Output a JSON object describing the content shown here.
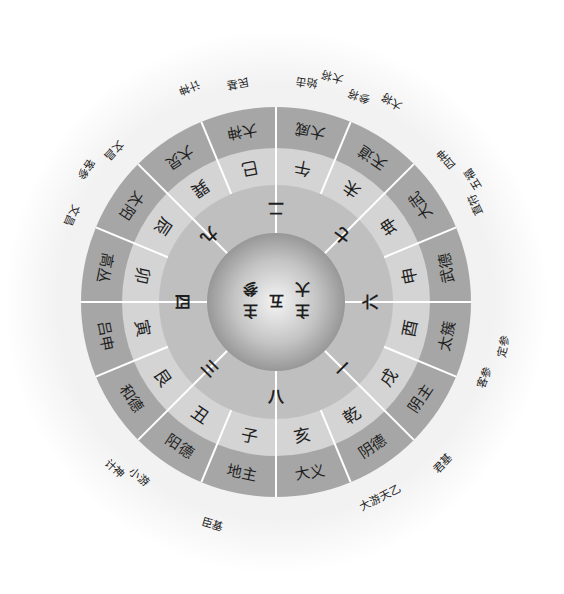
{
  "center": {
    "middle": "五",
    "right_column": [
      "主",
      "大"
    ],
    "left_column": [
      "主",
      "参"
    ]
  },
  "number_ring": [
    "二",
    "七",
    "六",
    "一",
    "八",
    "三",
    "四",
    "九"
  ],
  "branch_ring": [
    "午",
    "未",
    "坤",
    "申",
    "酉",
    "戌",
    "乾",
    "亥",
    "子",
    "丑",
    "艮",
    "寅",
    "卯",
    "辰",
    "巽",
    "巳"
  ],
  "outer_ring": [
    "大威",
    "天道",
    "大武",
    "武德",
    "太簇",
    "阴主",
    "阴德",
    "大义",
    "地主",
    "阳德",
    "和德",
    "吕申",
    "高丛",
    "太阳",
    "大炅",
    "大神"
  ],
  "external_labels": [
    {
      "text": "始击",
      "angle": 8
    },
    {
      "text": "大将",
      "angle": 14
    },
    {
      "text": "参将",
      "angle": 22
    },
    {
      "text": "大将",
      "angle": 30
    },
    {
      "text": "四神",
      "angle": 50
    },
    {
      "text": "五福",
      "angle": 58
    },
    {
      "text": "直符",
      "angle": 64
    },
    {
      "text": "定参",
      "angle": 101
    },
    {
      "text": "客参",
      "angle": 110
    },
    {
      "text": "君基",
      "angle": 134
    },
    {
      "text": "大游天乙",
      "angle": 152
    },
    {
      "text": "臣基",
      "angle": 196
    },
    {
      "text": "小游",
      "angle": 218
    },
    {
      "text": "计神",
      "angle": 224
    },
    {
      "text": "文昌",
      "angle": 293
    },
    {
      "text": "客参",
      "angle": 305
    },
    {
      "text": "文昌",
      "angle": 313
    },
    {
      "text": "计神",
      "angle": 338
    },
    {
      "text": "民基",
      "angle": 350
    }
  ],
  "colors": {
    "outer_band": "#a6a6a6",
    "branch_band": "#d4d4d4",
    "number_band": "#bfbfbf",
    "sphere_light": "#f4f4f4",
    "sphere_dark": "#8c8c8c",
    "separator": "#ffffff"
  }
}
